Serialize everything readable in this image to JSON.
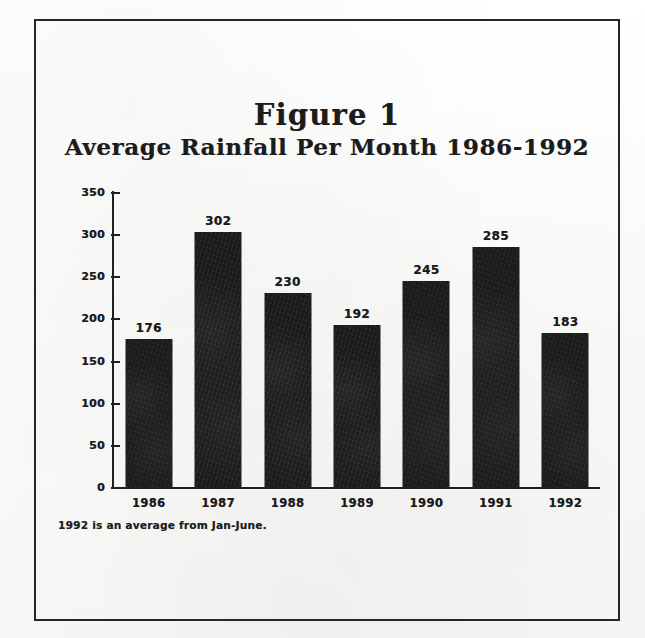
{
  "figure": {
    "frame_color": "#262626",
    "background_color": "#fdfdfd",
    "bar_color": "#1a1a1a",
    "axis_color": "#202020",
    "title_line1": "Figure 1",
    "title_line2": "Average Rainfall Per Month 1986-1992",
    "footnote": "1992 is an average from Jan-June."
  },
  "chart_data": {
    "type": "bar",
    "subtitle": "Average Rainfall Per Month 1986-1992",
    "xlabel": "",
    "ylabel": "",
    "categories": [
      "1986",
      "1987",
      "1988",
      "1989",
      "1990",
      "1991",
      "1992"
    ],
    "values": [
      176,
      302,
      230,
      192,
      245,
      285,
      183
    ],
    "data_labels": [
      "176",
      "302",
      "230",
      "192",
      "245",
      "285",
      "183"
    ],
    "ylim": [
      0,
      350
    ],
    "y_ticks": [
      0,
      50,
      100,
      150,
      200,
      250,
      300,
      350
    ],
    "y_tick_labels": [
      "0",
      "50",
      "100",
      "150",
      "200",
      "250",
      "300",
      "350"
    ],
    "grid": false,
    "legend": false,
    "annotations": [
      "1992 is an average from Jan-June."
    ]
  }
}
